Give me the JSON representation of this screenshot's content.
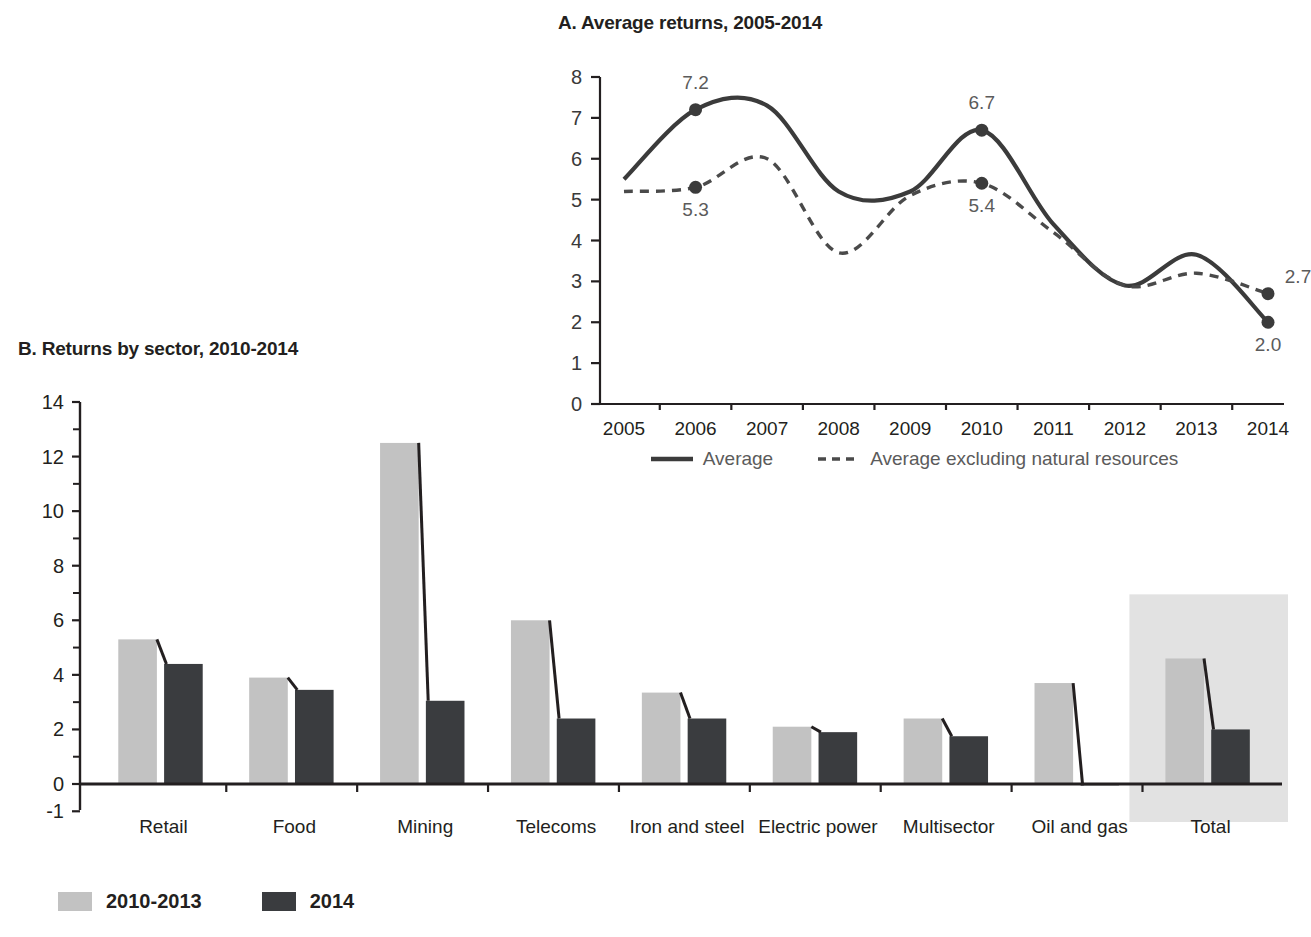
{
  "colors": {
    "line_solid": "#3b3b3b",
    "line_dashed": "#4a4a4a",
    "bar_light": "#c2c2c2",
    "bar_dark": "#3a3c3f",
    "highlight_band": "#e2e2e2",
    "axis": "#231f20",
    "label_gray": "#5b5b5b"
  },
  "panel_a": {
    "title": "A. Average returns, 2005-2014",
    "legend": [
      {
        "label": "Average",
        "style": "solid"
      },
      {
        "label": "Average excluding natural resources",
        "style": "dashed"
      }
    ]
  },
  "panel_b": {
    "title": "B. Returns by sector, 2010-2014",
    "legend": [
      {
        "label": "2010-2013",
        "swatch": "#c2c2c2"
      },
      {
        "label": "2014",
        "swatch": "#3a3c3f"
      }
    ]
  },
  "chart_data": [
    {
      "id": "panel-a",
      "type": "line",
      "title": "A. Average returns, 2005-2014",
      "xlabel": "",
      "ylabel": "",
      "x": [
        "2005",
        "2006",
        "2007",
        "2008",
        "2009",
        "2010",
        "2011",
        "2012",
        "2013",
        "2014"
      ],
      "ylim": [
        0,
        8
      ],
      "yticks": [
        0,
        1,
        2,
        3,
        4,
        5,
        6,
        7,
        8
      ],
      "grid": false,
      "legend_position": "bottom",
      "series": [
        {
          "name": "Average",
          "style": "solid",
          "values": [
            5.5,
            7.2,
            7.3,
            5.2,
            5.2,
            6.7,
            4.4,
            2.9,
            3.65,
            2.0
          ]
        },
        {
          "name": "Average excluding natural resources",
          "style": "dashed",
          "values": [
            5.2,
            5.3,
            6.0,
            3.7,
            5.1,
            5.4,
            4.2,
            2.9,
            3.2,
            2.7
          ]
        }
      ],
      "annotations": [
        {
          "text": "7.2",
          "series": "Average",
          "x": "2006",
          "value": 7.2
        },
        {
          "text": "6.7",
          "series": "Average",
          "x": "2010",
          "value": 6.7
        },
        {
          "text": "2.0",
          "series": "Average",
          "x": "2014",
          "value": 2.0
        },
        {
          "text": "5.3",
          "series": "Average excluding natural resources",
          "x": "2006",
          "value": 5.3
        },
        {
          "text": "5.4",
          "series": "Average excluding natural resources",
          "x": "2010",
          "value": 5.4
        },
        {
          "text": "2.7",
          "series": "Average excluding natural resources",
          "x": "2014",
          "value": 2.7
        }
      ]
    },
    {
      "id": "panel-b",
      "type": "bar",
      "title": "B. Returns by sector, 2010-2014",
      "xlabel": "",
      "ylabel": "",
      "categories": [
        "Retail",
        "Food",
        "Mining",
        "Telecoms",
        "Iron and steel",
        "Electric power",
        "Multisector",
        "Oil and gas",
        "Total"
      ],
      "ylim": [
        -1,
        14
      ],
      "yticks": [
        -1,
        0,
        2,
        4,
        6,
        8,
        10,
        12,
        14
      ],
      "ytick_labels": [
        "-1",
        "0",
        "2",
        "4",
        "6",
        "8",
        "10",
        "12",
        "14"
      ],
      "minor_yticks": [
        1,
        3,
        5,
        7,
        9,
        11,
        13
      ],
      "grid": false,
      "legend_position": "bottom-left",
      "highlight_category": "Total",
      "series": [
        {
          "name": "2010-2013",
          "values": [
            5.3,
            3.9,
            12.5,
            6.0,
            3.35,
            2.1,
            2.4,
            3.7,
            4.6
          ]
        },
        {
          "name": "2014",
          "values": [
            4.4,
            3.45,
            3.05,
            2.4,
            2.4,
            1.9,
            1.75,
            -0.05,
            2.0
          ]
        }
      ]
    }
  ]
}
